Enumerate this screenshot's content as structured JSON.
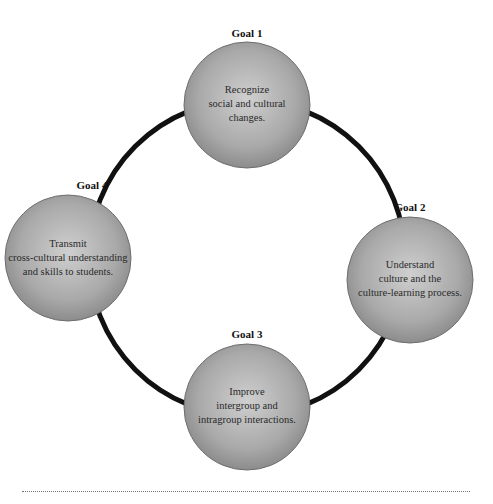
{
  "diagram": {
    "ring": {
      "cx": 247,
      "cy": 258,
      "r": 158,
      "stroke": "#111111",
      "stroke_width": 5
    },
    "colors": {
      "circle_center": "#c8c8c8",
      "circle_edge": "#8a8a8a",
      "circle_stroke": "#6e6e6e"
    },
    "goals": [
      {
        "label": "Goal 1",
        "lines": [
          "Recognize",
          "social and cultural",
          "changes."
        ],
        "cx": 247,
        "cy": 105,
        "r": 63
      },
      {
        "label": "Goal 2",
        "lines": [
          "Understand",
          "culture and the",
          "culture-learning process."
        ],
        "cx": 410,
        "cy": 280,
        "r": 63
      },
      {
        "label": "Goal 3",
        "lines": [
          "Improve",
          "intergroup and",
          "intragroup interactions."
        ],
        "cx": 247,
        "cy": 407,
        "r": 63
      },
      {
        "label": "Goal 4",
        "lines": [
          "Transmit",
          "cross-cultural understanding",
          "and skills to students."
        ],
        "cx": 68,
        "cy": 258,
        "r": 63
      }
    ]
  }
}
